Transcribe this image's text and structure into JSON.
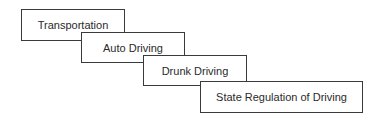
{
  "diagram": {
    "type": "nested-hierarchy-cascade",
    "boxes": [
      {
        "label": "Transportation",
        "level": 1
      },
      {
        "label": "Auto Driving",
        "level": 2
      },
      {
        "label": "Drunk Driving",
        "level": 3
      },
      {
        "label": "State Regulation of Driving",
        "level": 4
      }
    ]
  }
}
